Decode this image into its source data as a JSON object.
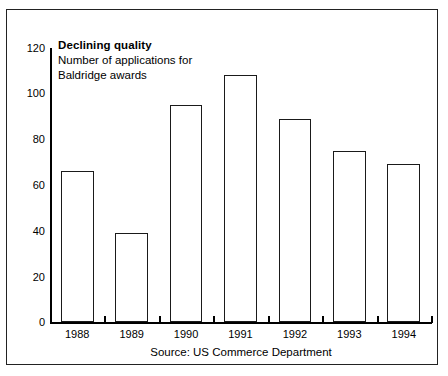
{
  "chart_data": {
    "type": "bar",
    "title": "Declining quality",
    "subtitle_line1": "Number of applications for",
    "subtitle_line2": "Baldridge awards",
    "source": "Source: US Commerce Department",
    "categories": [
      "1988",
      "1989",
      "1990",
      "1991",
      "1992",
      "1993",
      "1994"
    ],
    "values": [
      66,
      39,
      95,
      108,
      89,
      75,
      69
    ],
    "xlabel": "",
    "ylabel": "",
    "ylim": [
      0,
      120
    ],
    "yticks": [
      120,
      100,
      80,
      60,
      40,
      20,
      0
    ],
    "ytick_labels": [
      "120",
      "100",
      "80",
      "60",
      "40",
      "20",
      "0"
    ],
    "grid": false,
    "legend": null,
    "bar_fill_color": "#ffffff",
    "bar_edge_color": "#1a1a1a",
    "axis_color": "#000000",
    "background_color": "#ffffff",
    "frame_border_color": "#222222"
  }
}
